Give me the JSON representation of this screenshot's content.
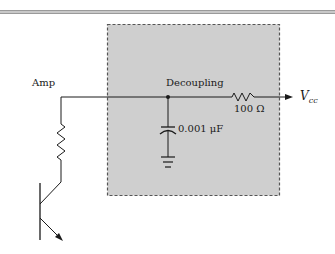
{
  "diagram": {
    "type": "circuit-schematic",
    "labels": {
      "amp": "Amp",
      "decoupling": "Decoupling",
      "resistor_value": "100 Ω",
      "capacitor_value": "0.001 μF",
      "vcc_main": "V",
      "vcc_sub": "cc"
    },
    "components": [
      {
        "type": "npn-transistor",
        "role": "amplifier"
      },
      {
        "type": "resistor",
        "role": "collector-load"
      },
      {
        "type": "resistor",
        "value": "100 Ω",
        "role": "decoupling"
      },
      {
        "type": "capacitor",
        "value": "0.001 μF",
        "role": "decoupling"
      },
      {
        "type": "ground"
      }
    ],
    "region": {
      "name": "decoupling-network",
      "style": "dashed-shaded",
      "fill": "#cfcfcf",
      "border": "#555555"
    }
  }
}
